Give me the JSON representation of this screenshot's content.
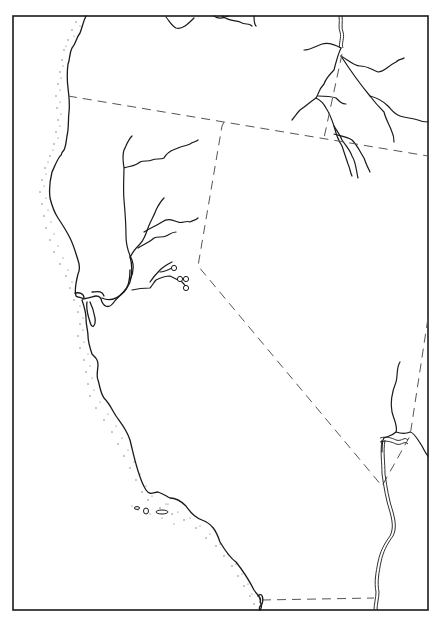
{
  "map": {
    "title": "",
    "region": "California and adjacent western North America (outline base map)",
    "frame": {
      "x": 13,
      "y": 16,
      "width": 415,
      "height": 594
    },
    "colors": {
      "line": "#1a1a1a",
      "border": "#555555",
      "background": "#ffffff",
      "stipple": "#666666"
    },
    "features": {
      "coastline": "Pacific coastline with stippled offshore shading",
      "state_borders": "dashed political boundaries",
      "rivers": [
        "Sacramento River system",
        "San Joaquin tributaries",
        "Columbia/Snake tributaries (NE)",
        "Colorado River (SE)"
      ],
      "bay": "San Francisco Bay",
      "islands": "Channel Islands",
      "site_markers": 4
    },
    "labels": []
  }
}
